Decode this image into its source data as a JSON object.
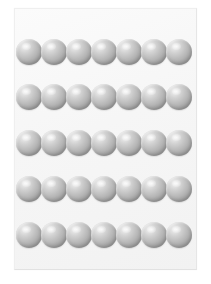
{
  "scene": {
    "title": "Grid of gray spheres",
    "background_color": "#ffffff",
    "width": 211,
    "height": 284
  },
  "panel": {
    "name": "sphere-panel",
    "background_color": "#f6f6f6",
    "border_color": "#e9e9e9",
    "left": 14,
    "top": 8,
    "width": 183,
    "height": 262
  },
  "sphere_style": {
    "diameter": 26,
    "highlight_color": "#f2f2f2",
    "mid_color": "#b2b2b2",
    "shadow_color": "#8c8c8c",
    "highlight_position": "upper-left"
  },
  "grid": {
    "rows": 5,
    "columns": 7,
    "total_spheres": 35,
    "row_tops": [
      30,
      75,
      121,
      167,
      213
    ],
    "column_lefts": [
      1,
      26,
      51,
      76,
      101,
      126,
      151
    ],
    "rows_data": [
      {
        "label": "row-1",
        "count": 7,
        "spheres": [
          {
            "label": "sphere-1-1"
          },
          {
            "label": "sphere-1-2"
          },
          {
            "label": "sphere-1-3"
          },
          {
            "label": "sphere-1-4"
          },
          {
            "label": "sphere-1-5"
          },
          {
            "label": "sphere-1-6"
          },
          {
            "label": "sphere-1-7"
          }
        ]
      },
      {
        "label": "row-2",
        "count": 7,
        "spheres": [
          {
            "label": "sphere-2-1"
          },
          {
            "label": "sphere-2-2"
          },
          {
            "label": "sphere-2-3"
          },
          {
            "label": "sphere-2-4"
          },
          {
            "label": "sphere-2-5"
          },
          {
            "label": "sphere-2-6"
          },
          {
            "label": "sphere-2-7"
          }
        ]
      },
      {
        "label": "row-3",
        "count": 7,
        "spheres": [
          {
            "label": "sphere-3-1"
          },
          {
            "label": "sphere-3-2"
          },
          {
            "label": "sphere-3-3"
          },
          {
            "label": "sphere-3-4"
          },
          {
            "label": "sphere-3-5"
          },
          {
            "label": "sphere-3-6"
          },
          {
            "label": "sphere-3-7"
          }
        ]
      },
      {
        "label": "row-4",
        "count": 7,
        "spheres": [
          {
            "label": "sphere-4-1"
          },
          {
            "label": "sphere-4-2"
          },
          {
            "label": "sphere-4-3"
          },
          {
            "label": "sphere-4-4"
          },
          {
            "label": "sphere-4-5"
          },
          {
            "label": "sphere-4-6"
          },
          {
            "label": "sphere-4-7"
          }
        ]
      },
      {
        "label": "row-5",
        "count": 7,
        "spheres": [
          {
            "label": "sphere-5-1"
          },
          {
            "label": "sphere-5-2"
          },
          {
            "label": "sphere-5-3"
          },
          {
            "label": "sphere-5-4"
          },
          {
            "label": "sphere-5-5"
          },
          {
            "label": "sphere-5-6"
          },
          {
            "label": "sphere-5-7"
          }
        ]
      }
    ]
  }
}
